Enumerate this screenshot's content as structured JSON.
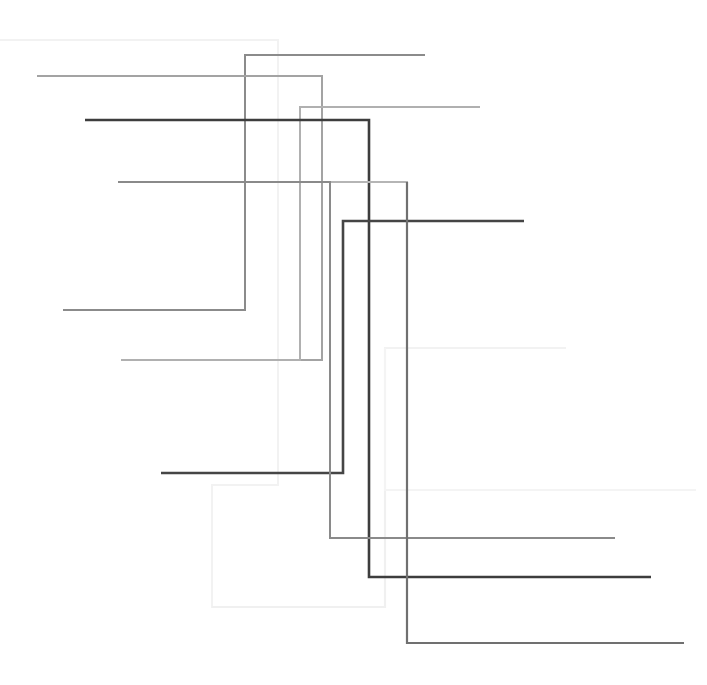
{
  "figure": {
    "type": "line-art",
    "width": 707,
    "height": 685,
    "background_color": "#ffffff"
  },
  "chart_data": {
    "type": "line",
    "subtitle": "",
    "xlabel": "",
    "ylabel": "",
    "xlim": [
      0,
      707
    ],
    "ylim": [
      0,
      685
    ],
    "grid": false,
    "legend_position": "none",
    "axis_visible": false,
    "tick_labels_x": [],
    "tick_labels_y": [],
    "annotations": [],
    "series": [
      {
        "name": "step-1",
        "color": "#f2f2f2",
        "width": 2.0,
        "points": [
          [
            0,
            40
          ],
          [
            278,
            40
          ],
          [
            278,
            485
          ],
          [
            212,
            485
          ],
          [
            212,
            607
          ],
          [
            385,
            607
          ],
          [
            385,
            348
          ],
          [
            566,
            348
          ]
        ]
      },
      {
        "name": "step-2",
        "color": "#f0f0f0",
        "width": 2.2,
        "points": [
          [
            385,
            348
          ],
          [
            385,
            607
          ],
          [
            212,
            607
          ]
        ]
      },
      {
        "name": "step-3",
        "color": "#8b8b8b",
        "width": 2.0,
        "points": [
          [
            425,
            55
          ],
          [
            245,
            55
          ],
          [
            245,
            310
          ],
          [
            63,
            310
          ]
        ]
      },
      {
        "name": "step-4",
        "color": "#a3a3a3",
        "width": 2.0,
        "points": [
          [
            37,
            76
          ],
          [
            322,
            76
          ],
          [
            322,
            360
          ],
          [
            121,
            360
          ]
        ]
      },
      {
        "name": "step-5",
        "color": "#b0b0b0",
        "width": 2.0,
        "points": [
          [
            480,
            107
          ],
          [
            300,
            107
          ],
          [
            300,
            360
          ],
          [
            121,
            360
          ]
        ]
      },
      {
        "name": "step-6",
        "color": "#3d3d3d",
        "width": 2.6,
        "points": [
          [
            85,
            120
          ],
          [
            369,
            120
          ],
          [
            369,
            577
          ],
          [
            651,
            577
          ]
        ]
      },
      {
        "name": "step-7",
        "color": "#b5b5b5",
        "width": 2.0,
        "points": [
          [
            118,
            182
          ],
          [
            407,
            182
          ],
          [
            407,
            643
          ],
          [
            684,
            643
          ]
        ]
      },
      {
        "name": "step-8",
        "color": "#454545",
        "width": 2.6,
        "points": [
          [
            524,
            221
          ],
          [
            343,
            221
          ],
          [
            343,
            473
          ],
          [
            161,
            473
          ]
        ]
      },
      {
        "name": "step-9",
        "color": "#8a8a8a",
        "width": 2.0,
        "points": [
          [
            615,
            538
          ],
          [
            330,
            538
          ],
          [
            330,
            182
          ],
          [
            118,
            182
          ]
        ]
      },
      {
        "name": "step-10",
        "color": "#f4f4f4",
        "width": 2.0,
        "points": [
          [
            696,
            490
          ],
          [
            385,
            490
          ],
          [
            385,
            348
          ]
        ]
      },
      {
        "name": "step-11",
        "color": "#707070",
        "width": 2.2,
        "points": [
          [
            684,
            643
          ],
          [
            407,
            643
          ],
          [
            407,
            182
          ]
        ]
      }
    ]
  },
  "paths": [
    {
      "id": "path-faint-outer",
      "name": "faint-outer-step",
      "stroke": "#f3f3f3",
      "stroke_width": 2.4,
      "d": "M 0 40 L 278 40 L 278 485 L 212 485 L 212 607 L 385 607 L 385 348 L 566 348"
    },
    {
      "id": "path-faint-right",
      "name": "faint-right-step",
      "stroke": "#f5f5f5",
      "stroke_width": 2.4,
      "d": "M 696 490 L 385 490"
    },
    {
      "id": "path-gray-a",
      "name": "gray-step-a",
      "stroke": "#8b8b8b",
      "stroke_width": 2.0,
      "d": "M 425 55 L 245 55 L 245 310 L 63 310"
    },
    {
      "id": "path-gray-b",
      "name": "gray-step-b",
      "stroke": "#a5a5a5",
      "stroke_width": 2.0,
      "d": "M 37 76 L 322 76 L 322 360 L 121 360"
    },
    {
      "id": "path-gray-c",
      "name": "gray-step-c",
      "stroke": "#b2b2b2",
      "stroke_width": 2.0,
      "d": "M 480 107 L 300 107 L 300 360 L 121 360"
    },
    {
      "id": "path-dark-a",
      "name": "dark-step-a",
      "stroke": "#3d3d3d",
      "stroke_width": 2.6,
      "d": "M 85 120 L 369 120 L 369 577 L 651 577"
    },
    {
      "id": "path-gray-d",
      "name": "gray-step-d",
      "stroke": "#b5b5b5",
      "stroke_width": 2.0,
      "d": "M 118 182 L 407 182 L 407 643 L 684 643"
    },
    {
      "id": "path-dark-b",
      "name": "dark-step-b",
      "stroke": "#454545",
      "stroke_width": 2.6,
      "d": "M 524 221 L 343 221 L 343 473 L 161 473"
    },
    {
      "id": "path-gray-e",
      "name": "gray-step-e",
      "stroke": "#8a8a8a",
      "stroke_width": 2.0,
      "d": "M 615 538 L 330 538 L 330 182"
    },
    {
      "id": "path-mid-f",
      "name": "mid-step-f",
      "stroke": "#707070",
      "stroke_width": 2.2,
      "d": "M 684 643 L 407 643"
    }
  ],
  "segments": {
    "horizontal_left_edges": [
      0,
      37,
      63,
      85,
      118,
      121,
      161,
      212,
      245
    ],
    "horizontal_right_edges": [
      425,
      480,
      524,
      566,
      615,
      651,
      684,
      696
    ],
    "vertical_x_positions": [
      212,
      245,
      278,
      300,
      322,
      330,
      343,
      369,
      385,
      407
    ],
    "row_y_positions": [
      40,
      55,
      76,
      107,
      120,
      182,
      221,
      310,
      348,
      360,
      473,
      490,
      538,
      577,
      607,
      643
    ]
  },
  "palette": {
    "darkest": "#3d3d3d",
    "dark": "#454545",
    "mid_dark": "#707070",
    "mid": "#8a8a8a",
    "mid_light": "#a5a5a5",
    "light": "#b5b5b5",
    "faint": "#f3f3f3",
    "background": "#ffffff"
  }
}
